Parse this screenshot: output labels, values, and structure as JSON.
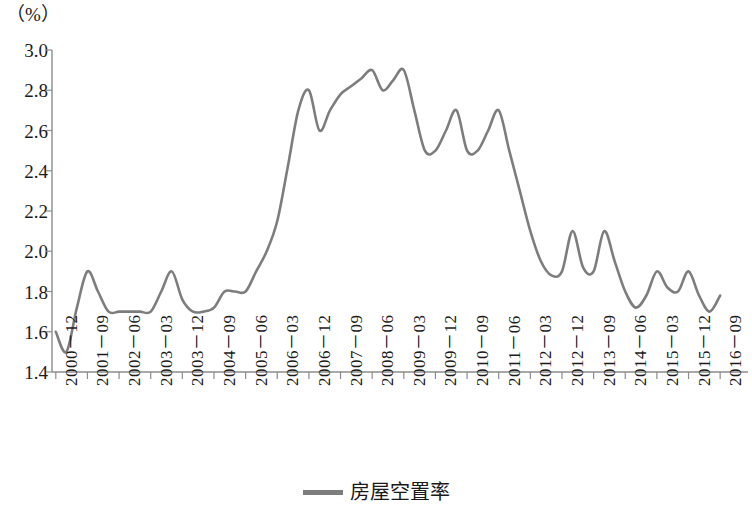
{
  "figure": {
    "unit_label": "（%）",
    "line_color": "#7d7d7d",
    "axis_color": "#8c8c8c",
    "background": "#ffffff"
  },
  "legend": {
    "position": "bottom-center",
    "swatch_name": "line-swatch",
    "label": "房屋空置率"
  },
  "chart_data": {
    "type": "line",
    "title": "",
    "subtitle": "",
    "xlabel": "",
    "ylabel": "（%）",
    "ylim": [
      1.4,
      3.0
    ],
    "ytick_step": 0.2,
    "ytick_labels": [
      "3.0",
      "2.8",
      "2.6",
      "2.4",
      "2.2",
      "2.0",
      "1.8",
      "1.6",
      "1.4"
    ],
    "ytick_values": [
      3.0,
      2.8,
      2.6,
      2.4,
      2.2,
      2.0,
      1.8,
      1.6,
      1.4
    ],
    "grid": false,
    "legend_position": "bottom",
    "xtick_labels": [
      "2000－12",
      "2001－09",
      "2002－06",
      "2003－03",
      "2003－12",
      "2004－09",
      "2005－06",
      "2006－03",
      "2006－12",
      "2007－09",
      "2008－06",
      "2009－03",
      "2009－12",
      "2010－09",
      "2011－06",
      "2012－03",
      "2012－12",
      "2013－09",
      "2014－06",
      "2015－03",
      "2015－12",
      "2016－09"
    ],
    "xtick_interval_months": 9,
    "series": [
      {
        "name": "房屋空置率",
        "color": "#7d7d7d",
        "x": [
          "2000-12",
          "2001-03",
          "2001-06",
          "2001-09",
          "2001-12",
          "2002-03",
          "2002-06",
          "2002-09",
          "2002-12",
          "2003-03",
          "2003-06",
          "2003-09",
          "2003-12",
          "2004-03",
          "2004-06",
          "2004-09",
          "2004-12",
          "2005-03",
          "2005-06",
          "2005-09",
          "2005-12",
          "2006-03",
          "2006-06",
          "2006-09",
          "2006-12",
          "2007-03",
          "2007-06",
          "2007-09",
          "2007-12",
          "2008-03",
          "2008-06",
          "2008-09",
          "2008-12",
          "2009-03",
          "2009-06",
          "2009-09",
          "2009-12",
          "2010-03",
          "2010-06",
          "2010-09",
          "2010-12",
          "2011-03",
          "2011-06",
          "2011-09",
          "2011-12",
          "2012-03",
          "2012-06",
          "2012-09",
          "2012-12",
          "2013-03",
          "2013-06",
          "2013-09",
          "2013-12",
          "2014-03",
          "2014-06",
          "2014-09",
          "2014-12",
          "2015-03",
          "2015-06",
          "2015-09",
          "2015-12",
          "2016-03",
          "2016-06",
          "2016-09"
        ],
        "values": [
          1.6,
          1.5,
          1.72,
          1.9,
          1.8,
          1.7,
          1.7,
          1.7,
          1.7,
          1.7,
          1.8,
          1.9,
          1.76,
          1.7,
          1.7,
          1.72,
          1.8,
          1.8,
          1.8,
          1.9,
          2.0,
          2.15,
          2.42,
          2.7,
          2.8,
          2.6,
          2.7,
          2.78,
          2.82,
          2.86,
          2.9,
          2.8,
          2.85,
          2.9,
          2.7,
          2.5,
          2.5,
          2.6,
          2.7,
          2.5,
          2.5,
          2.6,
          2.7,
          2.5,
          2.3,
          2.1,
          1.95,
          1.88,
          1.9,
          2.1,
          1.92,
          1.9,
          2.1,
          1.95,
          1.8,
          1.72,
          1.78,
          1.9,
          1.82,
          1.8,
          1.9,
          1.78,
          1.7,
          1.78
        ]
      }
    ],
    "annotations": []
  }
}
